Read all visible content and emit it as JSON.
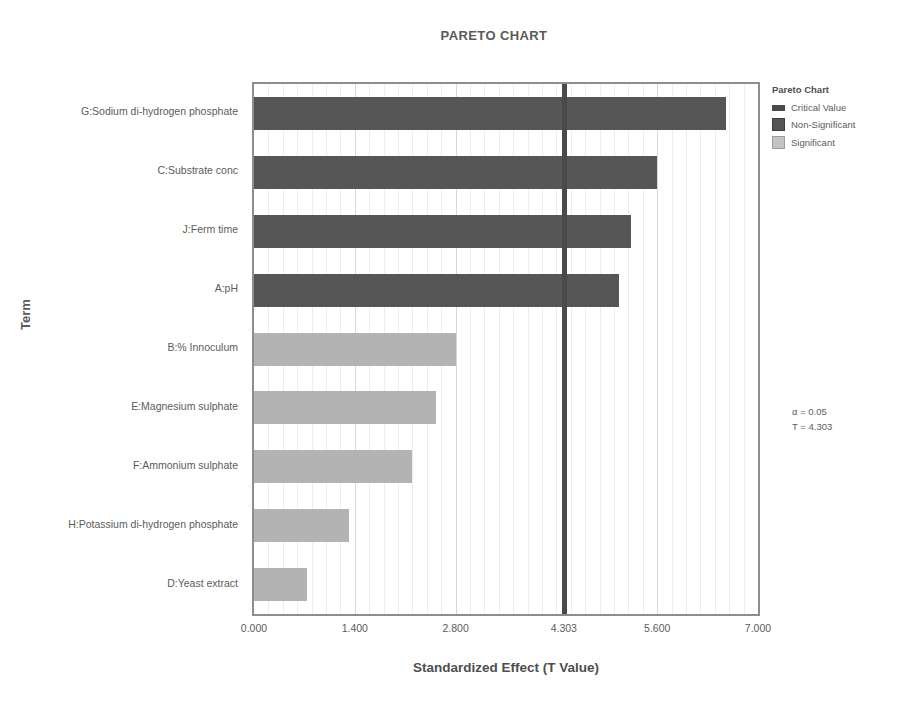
{
  "chart_data": {
    "type": "bar",
    "title": "PARETO CHART",
    "xlabel": "Standardized Effect (T Value)",
    "ylabel": "Term",
    "orientation": "horizontal",
    "xlim": [
      0.0,
      7.0
    ],
    "xticks": [
      "0.000",
      "1.400",
      "2.800",
      "4.303",
      "5.600",
      "7.000"
    ],
    "xtick_values": [
      0.0,
      1.4,
      2.8,
      4.303,
      5.6,
      7.0
    ],
    "grid": true,
    "legend_position": "right",
    "categories": [
      "G:Sodium di-hydrogen phosphate",
      "C:Substrate conc",
      "J:Ferm time",
      "A:pH",
      "B:% Innoculum",
      "E:Magnesium sulphate",
      "F:Ammonium sulphate",
      "H:Potassium di-hydrogen phosphate",
      "D:Yeast extract"
    ],
    "values": [
      6.55,
      5.6,
      5.23,
      5.07,
      2.8,
      2.53,
      2.2,
      1.32,
      0.73
    ],
    "series": [
      {
        "name": "Standardized Effect",
        "values": [
          6.55,
          5.6,
          5.23,
          5.07,
          2.8,
          2.53,
          2.2,
          1.32,
          0.73
        ],
        "significance": [
          "Non-Significant",
          "Non-Significant",
          "Non-Significant",
          "Non-Significant",
          "Significant",
          "Significant",
          "Significant",
          "Significant",
          "Significant"
        ]
      }
    ],
    "critical_value": 4.303,
    "annotations": [
      "α = 0.05",
      "T = 4.303"
    ],
    "colors": {
      "non_significant": "#565656",
      "significant": "#b3b3b3",
      "critical_line": "#4a4a4a",
      "axis": "#8d8d8d",
      "text": "#5c5c5c"
    }
  },
  "legend": {
    "title": "Pareto Chart",
    "items": [
      {
        "label": "Critical Value",
        "swatch": "critical"
      },
      {
        "label": "Non-Significant",
        "swatch": "nonsig"
      },
      {
        "label": "Significant",
        "swatch": "sig"
      }
    ]
  },
  "annotation": {
    "alpha_line": "α = 0.05",
    "t_line": "T = 4.303"
  }
}
